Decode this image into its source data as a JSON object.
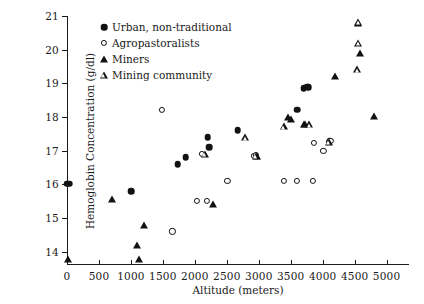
{
  "chart_data": {
    "type": "scatter",
    "title": "",
    "xlabel": "Altitude (meters)",
    "ylabel": "Hemoglobin Concentration (g/dl)",
    "xlim": [
      0,
      5350
    ],
    "ylim": [
      13.6,
      21
    ],
    "xticks": [
      0,
      500,
      1000,
      1500,
      2000,
      2500,
      3000,
      3500,
      4000,
      4500,
      5000
    ],
    "xticklabels": [
      "0",
      "500",
      "1000",
      "1500",
      "2000",
      "2500",
      "3000",
      "3500",
      "4000",
      "4500",
      "5000"
    ],
    "yticks": [
      14,
      15,
      16,
      17,
      18,
      19,
      20,
      21
    ],
    "yticklabels": [
      "14",
      "15",
      "16",
      "17",
      "18",
      "19",
      "20",
      "21"
    ],
    "grid": false,
    "legend_position": "upper left",
    "series": [
      {
        "name": "Urban, non-traditional",
        "marker": "circle-filled",
        "points": [
          [
            0,
            16.02
          ],
          [
            30,
            16.02
          ],
          [
            1000,
            15.8
          ],
          [
            1730,
            16.6
          ],
          [
            1860,
            16.8
          ],
          [
            2200,
            17.4
          ],
          [
            2220,
            17.1
          ],
          [
            2670,
            17.6
          ],
          [
            3600,
            18.22
          ],
          [
            3700,
            18.85
          ],
          [
            3755,
            18.9
          ],
          [
            3775,
            18.88
          ],
          [
            4110,
            17.3
          ]
        ]
      },
      {
        "name": "Agropastoralists",
        "marker": "circle-open",
        "points": [
          [
            1490,
            18.2
          ],
          [
            1650,
            14.6
          ],
          [
            2030,
            15.5
          ],
          [
            2190,
            15.5
          ],
          [
            2110,
            16.9
          ],
          [
            2510,
            16.1
          ],
          [
            2930,
            16.85
          ],
          [
            2960,
            16.88
          ],
          [
            3390,
            16.1
          ],
          [
            3600,
            16.1
          ],
          [
            3850,
            16.1
          ],
          [
            3860,
            17.22
          ],
          [
            4010,
            17.0
          ],
          [
            4095,
            17.25
          ],
          [
            4120,
            17.3
          ]
        ]
      },
      {
        "name": "Miners",
        "marker": "triangle-filled",
        "points": [
          [
            20,
            13.78
          ],
          [
            710,
            15.55
          ],
          [
            1100,
            14.2
          ],
          [
            1200,
            14.8
          ],
          [
            1120,
            13.78
          ],
          [
            2290,
            15.4
          ],
          [
            2970,
            16.85
          ],
          [
            3450,
            18.0
          ],
          [
            3500,
            17.95
          ],
          [
            3700,
            17.78
          ],
          [
            3720,
            17.8
          ],
          [
            4200,
            19.22
          ],
          [
            4550,
            20.8
          ],
          [
            4580,
            19.9
          ],
          [
            4800,
            18.02
          ]
        ]
      },
      {
        "name": "Mining community",
        "marker": "triangle-open",
        "points": [
          [
            2160,
            16.9
          ],
          [
            2790,
            17.4
          ],
          [
            2950,
            16.85
          ],
          [
            3390,
            17.72
          ],
          [
            3790,
            17.78
          ],
          [
            4100,
            17.26
          ],
          [
            4560,
            20.82
          ],
          [
            4560,
            20.2
          ],
          [
            4540,
            19.42
          ]
        ]
      }
    ]
  },
  "legend": {
    "items": [
      {
        "label": "Urban, non-traditional",
        "marker": "circle-filled"
      },
      {
        "label": "Agropastoralists",
        "marker": "circle-open"
      },
      {
        "label": "Miners",
        "marker": "triangle-filled"
      },
      {
        "label": "Mining community",
        "marker": "triangle-open"
      }
    ]
  },
  "colors": {
    "marker": "#121212",
    "axis": "#1a1a1a",
    "background": "#ffffff"
  }
}
